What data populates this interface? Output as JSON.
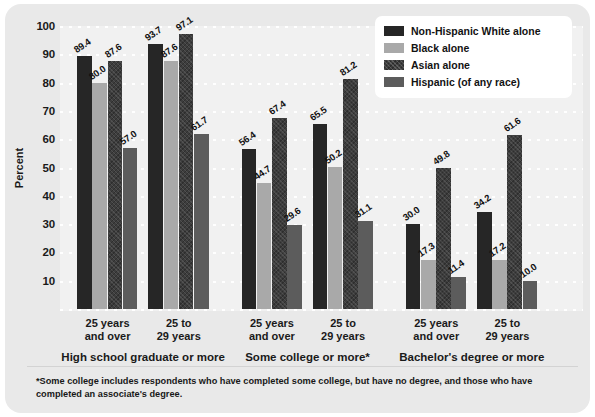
{
  "chart_data": {
    "type": "bar",
    "title": "",
    "subtitle": "",
    "xlabel": "",
    "ylabel": "Percent",
    "ylim": [
      0,
      100
    ],
    "yticks": [
      10,
      20,
      30,
      40,
      50,
      60,
      70,
      80,
      90,
      100
    ],
    "grid": true,
    "legend_position": "top-right",
    "legend": [
      "Non-Hispanic White alone",
      "Black alone",
      "Asian alone",
      "Hispanic (of any race)"
    ],
    "categories": [
      "25 years and over",
      "25 to 29 years",
      "25 years and over",
      "25 to 29 years",
      "25 years and over",
      "25 to 29 years"
    ],
    "group_titles": [
      "High school graduate or more",
      "Some college or more*",
      "Bachelor's degree or more"
    ],
    "series": [
      {
        "name": "Non-Hispanic White alone",
        "values": [
          89.4,
          93.7,
          56.4,
          65.5,
          30.0,
          34.2
        ]
      },
      {
        "name": "Black alone",
        "values": [
          80.0,
          87.6,
          44.7,
          50.2,
          17.3,
          17.2
        ]
      },
      {
        "name": "Asian alone",
        "values": [
          87.6,
          97.1,
          67.4,
          81.2,
          49.8,
          61.6
        ]
      },
      {
        "name": "Hispanic (of any race)",
        "values": [
          57.0,
          61.7,
          29.6,
          31.1,
          11.4,
          10.0
        ]
      }
    ],
    "data_labels": [
      [
        "89.4",
        "80.0",
        "87.6",
        "57.0"
      ],
      [
        "93.7",
        "87.6",
        "97.1",
        "61.7"
      ],
      [
        "56.4",
        "44.7",
        "67.4",
        "29.6"
      ],
      [
        "65.5",
        "50.2",
        "81.2",
        "31.1"
      ],
      [
        "30.0",
        "17.3",
        "49.8",
        "11.4"
      ],
      [
        "34.2",
        "17.2",
        "61.6",
        "10.0"
      ]
    ],
    "colors": {
      "series_0": "#262626",
      "series_1": "#a9a9a9",
      "series_2": "#3d3d3d",
      "series_3": "#5c5c5c",
      "card_background": "#e9e9e9",
      "plot_background": "#f1f1f1",
      "gridline": "#ffffff",
      "text": "#1a1a1a"
    }
  },
  "footnote": "*Some college includes respondents who have completed some college, but have no degree, and those who have completed an associate's degree."
}
